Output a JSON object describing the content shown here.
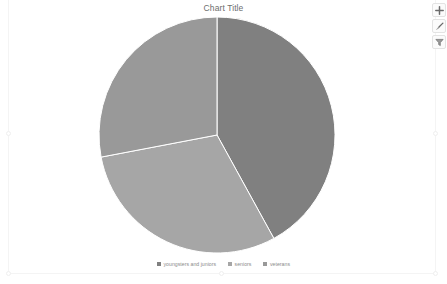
{
  "chart": {
    "title": "Chart Title"
  },
  "legend": {
    "items": [
      {
        "label": "youngsters and juniors",
        "color": "#808080"
      },
      {
        "label": "seniors",
        "color": "#a6a6a6"
      },
      {
        "label": "veterans",
        "color": "#999999"
      }
    ]
  },
  "buttons": [
    {
      "name": "chart-elements-button",
      "icon": "plus-icon",
      "label": "+"
    },
    {
      "name": "chart-styles-button",
      "icon": "paintbrush-icon",
      "label": ""
    },
    {
      "name": "chart-filters-button",
      "icon": "funnel-filter-icon",
      "label": ""
    }
  ],
  "chart_data": {
    "type": "pie",
    "title": "Chart Title",
    "categories": [
      "youngsters and juniors",
      "seniors",
      "veterans"
    ],
    "values": [
      42,
      30,
      28
    ],
    "colors": [
      "#808080",
      "#a6a6a6",
      "#999999"
    ],
    "start_angle": 0,
    "slice_angles": [
      152,
      108,
      100
    ],
    "legend": "bottom",
    "grid": false,
    "data_labels": false,
    "center": [
      217,
      135
    ],
    "radius": 118
  }
}
